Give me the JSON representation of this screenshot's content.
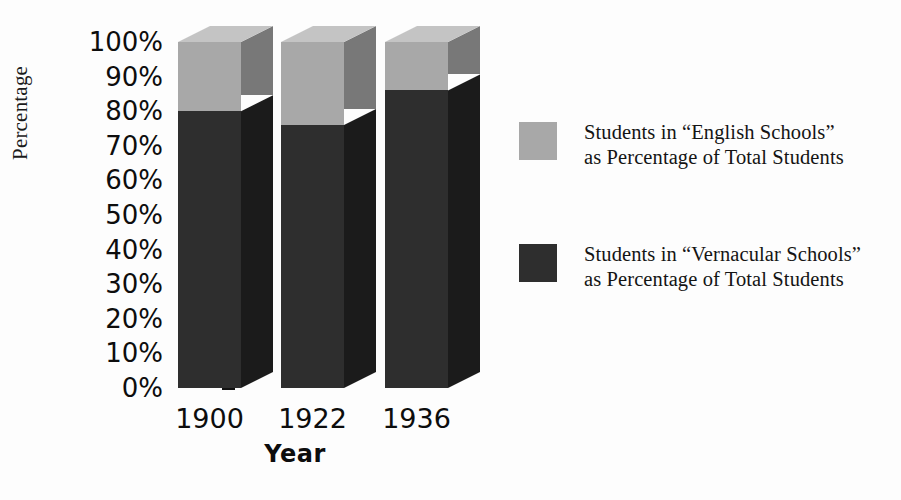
{
  "chart_data": {
    "type": "bar",
    "subtype": "100% stacked column (3D)",
    "title": "",
    "xlabel": "Year",
    "ylabel": "Percentage",
    "categories": [
      "1900",
      "1922",
      "1936"
    ],
    "ylim": [
      0,
      100
    ],
    "y_ticks": [
      "0%",
      "10%",
      "20%",
      "30%",
      "40%",
      "50%",
      "60%",
      "70%",
      "80%",
      "90%",
      "100%"
    ],
    "y_tick_values": [
      0,
      10,
      20,
      30,
      40,
      50,
      60,
      70,
      80,
      90,
      100
    ],
    "grid": false,
    "legend_position": "right",
    "series": [
      {
        "name": "Students in “Vernacular Schools” as Percentage of Total Students",
        "color": "#2e2e2e",
        "values": [
          80,
          76,
          86
        ],
        "stack_order": 0
      },
      {
        "name": "Students in “English Schools” as Percentage of Total Students",
        "color": "#a8a8a8",
        "values": [
          20,
          24,
          14
        ],
        "stack_order": 1
      }
    ]
  },
  "axes": {
    "y_title": "Percentage",
    "x_title": "Year",
    "y_ticks": [
      "100%",
      "90%",
      "80%",
      "70%",
      "60%",
      "50%",
      "40%",
      "30%",
      "20%",
      "10%",
      "0%"
    ],
    "x_ticks": [
      "1900",
      "1922",
      "1936"
    ]
  },
  "legend": {
    "entries": [
      {
        "swatch_color": "#a8a8a8",
        "line1": "Students in “English Schools”",
        "line2": "as Percentage of Total Students"
      },
      {
        "swatch_color": "#2e2e2e",
        "line1": "Students in “Vernacular Schools”",
        "line2": "as Percentage of Total Students"
      }
    ]
  },
  "colors": {
    "english_front": "#a8a8a8",
    "english_side": "#787878",
    "english_top": "#c4c4c4",
    "vernacular_front": "#2e2e2e",
    "vernacular_side": "#1b1b1b",
    "axis": "#111111",
    "background": "#fdfdfd"
  }
}
